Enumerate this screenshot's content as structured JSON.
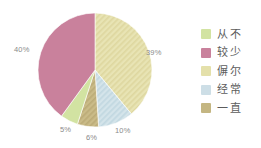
{
  "chart_data": {
    "type": "pie",
    "title": "",
    "subtitle": "",
    "xlabel": "",
    "ylabel": "",
    "legend_position": "right",
    "grid": false,
    "start_angle_deg": 0,
    "direction": "clockwise",
    "categories": [
      "偋尔",
      "经常",
      "一直",
      "从不",
      "较少"
    ],
    "values": [
      39,
      10,
      6,
      5,
      40
    ],
    "data_labels": [
      "39%",
      "10%",
      "6%",
      "5%",
      "40%"
    ],
    "colors": [
      "#e4e0aa",
      "#cddee6",
      "#c4b682",
      "#d2e3a2",
      "#c9819c"
    ],
    "slices": [
      {
        "label": "偋尔",
        "value": 39,
        "data_label": "39%",
        "color": "#e4e0aa",
        "pattern": "diagonal-stripes"
      },
      {
        "label": "经常",
        "value": 10,
        "data_label": "10%",
        "color": "#cddee6",
        "pattern": "diagonal-stripes"
      },
      {
        "label": "一直",
        "value": 6,
        "data_label": "6%",
        "color": "#c4b682",
        "pattern": "diagonal-stripes"
      },
      {
        "label": "从不",
        "value": 5,
        "data_label": "5%",
        "color": "#d2e3a2",
        "pattern": "none"
      },
      {
        "label": "较少",
        "value": 40,
        "data_label": "40%",
        "color": "#c9819c",
        "pattern": "none"
      }
    ]
  },
  "legend": {
    "items": [
      {
        "label": "从不",
        "color": "#d2e3a2"
      },
      {
        "label": "较少",
        "color": "#c9819c"
      },
      {
        "label": "偋尔",
        "color": "#e4e0aa"
      },
      {
        "label": "经常",
        "color": "#cddee6"
      },
      {
        "label": "一直",
        "color": "#c4b682"
      }
    ]
  },
  "style": {
    "background": "#ffffff",
    "label_color": "#8a8a8a",
    "legend_text_color": "#5c5c5c"
  }
}
